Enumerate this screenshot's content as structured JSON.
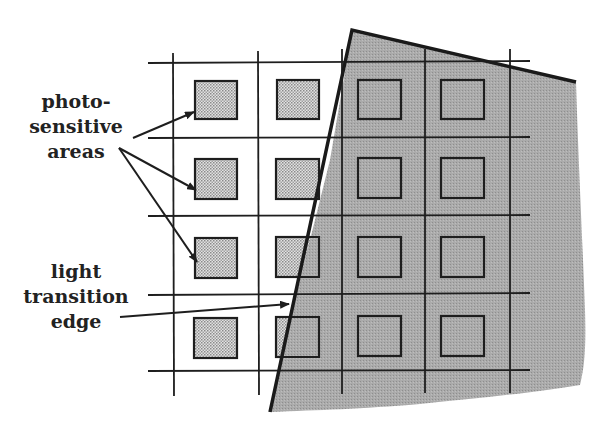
{
  "figure": {
    "labels": {
      "photosensitive": [
        "photo-",
        "sensitive",
        "areas"
      ],
      "edge": [
        "light",
        "transition",
        "edge"
      ]
    },
    "colors": {
      "line": "#1e1e1e",
      "cell_fill": "#c4c4c4",
      "shadow_fill": "#a9a9a9",
      "background": "#ffffff"
    },
    "grid": {
      "columns": 4,
      "rows": 4,
      "vertical_lines_x": [
        173,
        258,
        342,
        425,
        510
      ],
      "horizontal_lines_y": [
        63,
        138,
        216,
        295,
        371
      ]
    },
    "shadow_region": "light transition edge covers right portion of the grid"
  }
}
